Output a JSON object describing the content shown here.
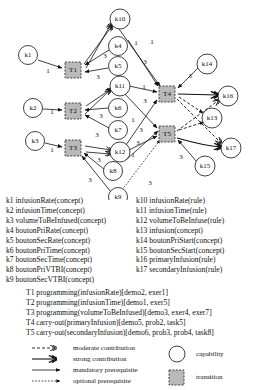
{
  "graph": {
    "capabilities": [
      {
        "id": "k1",
        "label": "k1",
        "x": 28,
        "y": 55
      },
      {
        "id": "k2",
        "label": "k2",
        "x": 33,
        "y": 108
      },
      {
        "id": "k3",
        "label": "k3",
        "x": 35,
        "y": 141
      },
      {
        "id": "k4",
        "label": "k4",
        "x": 118,
        "y": 46
      },
      {
        "id": "k5",
        "label": "k5",
        "x": 118,
        "y": 66
      },
      {
        "id": "k6",
        "label": "k6",
        "x": 118,
        "y": 108
      },
      {
        "id": "k7",
        "label": "k7",
        "x": 118,
        "y": 130
      },
      {
        "id": "k8",
        "label": "k8",
        "x": 113,
        "y": 171
      },
      {
        "id": "k9",
        "label": "k9",
        "x": 118,
        "y": 197
      },
      {
        "id": "k10",
        "label": "k10",
        "x": 120,
        "y": 19
      },
      {
        "id": "k11",
        "label": "k11",
        "x": 120,
        "y": 86
      },
      {
        "id": "k12",
        "label": "k12",
        "x": 120,
        "y": 152
      },
      {
        "id": "k13",
        "label": "k13",
        "x": 212,
        "y": 118
      },
      {
        "id": "k14",
        "label": "k14",
        "x": 207,
        "y": 64
      },
      {
        "id": "k15",
        "label": "k15",
        "x": 205,
        "y": 166
      },
      {
        "id": "k16",
        "label": "k16",
        "x": 228,
        "y": 96
      },
      {
        "id": "k17",
        "label": "k17",
        "x": 231,
        "y": 148
      }
    ],
    "transitions": [
      {
        "id": "T1",
        "label": "T1",
        "x": 73,
        "y": 70
      },
      {
        "id": "T2",
        "label": "T2",
        "x": 73,
        "y": 111
      },
      {
        "id": "T3",
        "label": "T3",
        "x": 73,
        "y": 148
      },
      {
        "id": "T4",
        "label": "T4",
        "x": 167,
        "y": 94
      },
      {
        "id": "T5",
        "label": "T5",
        "x": 167,
        "y": 134
      }
    ],
    "edge_weights": [
      {
        "value": "1",
        "x": 48,
        "y": 71
      },
      {
        "value": "3",
        "x": 105,
        "y": 56
      },
      {
        "value": "3",
        "x": 98,
        "y": 77
      },
      {
        "value": "1",
        "x": 52,
        "y": 112
      },
      {
        "value": "3",
        "x": 101,
        "y": 116
      },
      {
        "value": "3",
        "x": 97,
        "y": 135
      },
      {
        "value": "1",
        "x": 52,
        "y": 150
      },
      {
        "value": "3",
        "x": 99,
        "y": 160
      },
      {
        "value": "3",
        "x": 90,
        "y": 180
      },
      {
        "value": "1",
        "x": 136,
        "y": 43
      },
      {
        "value": "1",
        "x": 152,
        "y": 42
      },
      {
        "value": "3",
        "x": 145,
        "y": 62
      },
      {
        "value": "3",
        "x": 190,
        "y": 76
      },
      {
        "value": "1",
        "x": 144,
        "y": 87
      },
      {
        "value": "3",
        "x": 145,
        "y": 101
      },
      {
        "value": "1",
        "x": 133,
        "y": 120
      },
      {
        "value": "3",
        "x": 141,
        "y": 130
      },
      {
        "value": "3",
        "x": 138,
        "y": 143
      },
      {
        "value": "1",
        "x": 133,
        "y": 155
      },
      {
        "value": "3",
        "x": 181,
        "y": 157
      },
      {
        "value": "3",
        "x": 150,
        "y": 183
      }
    ]
  },
  "legend_k": {
    "left": [
      "k1 infusionRate(concept)",
      "k2 infusionTime(concept)",
      "k3 volumeToBeInfused(concept)",
      "k4 boutonPriRate(concept)",
      "k5 boutonSecRate(concept)",
      "k6 boutonPriTime(concept)",
      "k7 boutonSecTime(concept)",
      "k8 boutonPriVTBI(concept)",
      "k9 boutonSecVTBI(concept)"
    ],
    "right": [
      "k10 infusionRate(rule)",
      "k11 infusionTime(rule)",
      "k12 volumeToBeInfuse(rule)",
      "k13 infusion(concept)",
      "k14 boutonPriStart(concept)",
      "k15 boutonSecStart(concept)",
      "k16 primaryInfusion(rule)",
      "k17 secondaryInfusion(rule)"
    ]
  },
  "legend_t": [
    "T1 programming(infusionRate)[demo2, exer1]",
    "T2 programming(infusionTime)[demo1, exer5]",
    "T3 programming(volumeToBeInfused)[demo3, exer4, exer7]",
    "T4 carry-out(primaryInfusion)[demo5, prob2, task5]",
    "T5 carry-out(secondaryInfusion)[demo6, prob3, prob4, task8]"
  ],
  "legend_symbols": {
    "edges": [
      "moderate contribution",
      "strong contribution",
      "mandatory prerequisite",
      "optional prerequisite"
    ],
    "nodes": [
      "capability",
      "transition"
    ]
  }
}
